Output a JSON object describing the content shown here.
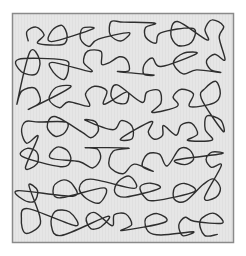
{
  "figure": {
    "colors": {
      "background": "#ffffff",
      "panel_fill": "#e6e6e6",
      "panel_border": "#8a8a8a",
      "line": "#2e2e2e"
    },
    "pattern": {
      "style": "single continuous meandering line",
      "lobe_columns": 7,
      "lobe_rows": 7,
      "seed": 17
    }
  }
}
